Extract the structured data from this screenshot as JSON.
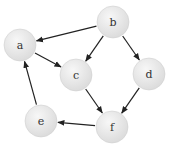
{
  "graph": {
    "type": "directed",
    "nodes": [
      {
        "id": "a",
        "label": "a",
        "x": 20,
        "y": 45
      },
      {
        "id": "b",
        "label": "b",
        "x": 113,
        "y": 22
      },
      {
        "id": "c",
        "label": "c",
        "x": 76,
        "y": 75
      },
      {
        "id": "d",
        "label": "d",
        "x": 149,
        "y": 74
      },
      {
        "id": "e",
        "label": "e",
        "x": 41,
        "y": 121
      },
      {
        "id": "f",
        "label": "f",
        "x": 112,
        "y": 127
      }
    ],
    "edges": [
      {
        "from": "b",
        "to": "a"
      },
      {
        "from": "b",
        "to": "c"
      },
      {
        "from": "b",
        "to": "d"
      },
      {
        "from": "a",
        "to": "c"
      },
      {
        "from": "c",
        "to": "f"
      },
      {
        "from": "d",
        "to": "f"
      },
      {
        "from": "f",
        "to": "e"
      },
      {
        "from": "e",
        "to": "a"
      }
    ],
    "node_radius": 16,
    "colors": {
      "node_fill": "#e8e8e8",
      "node_edge": "#d0d0d0",
      "edge": "#222222"
    }
  }
}
